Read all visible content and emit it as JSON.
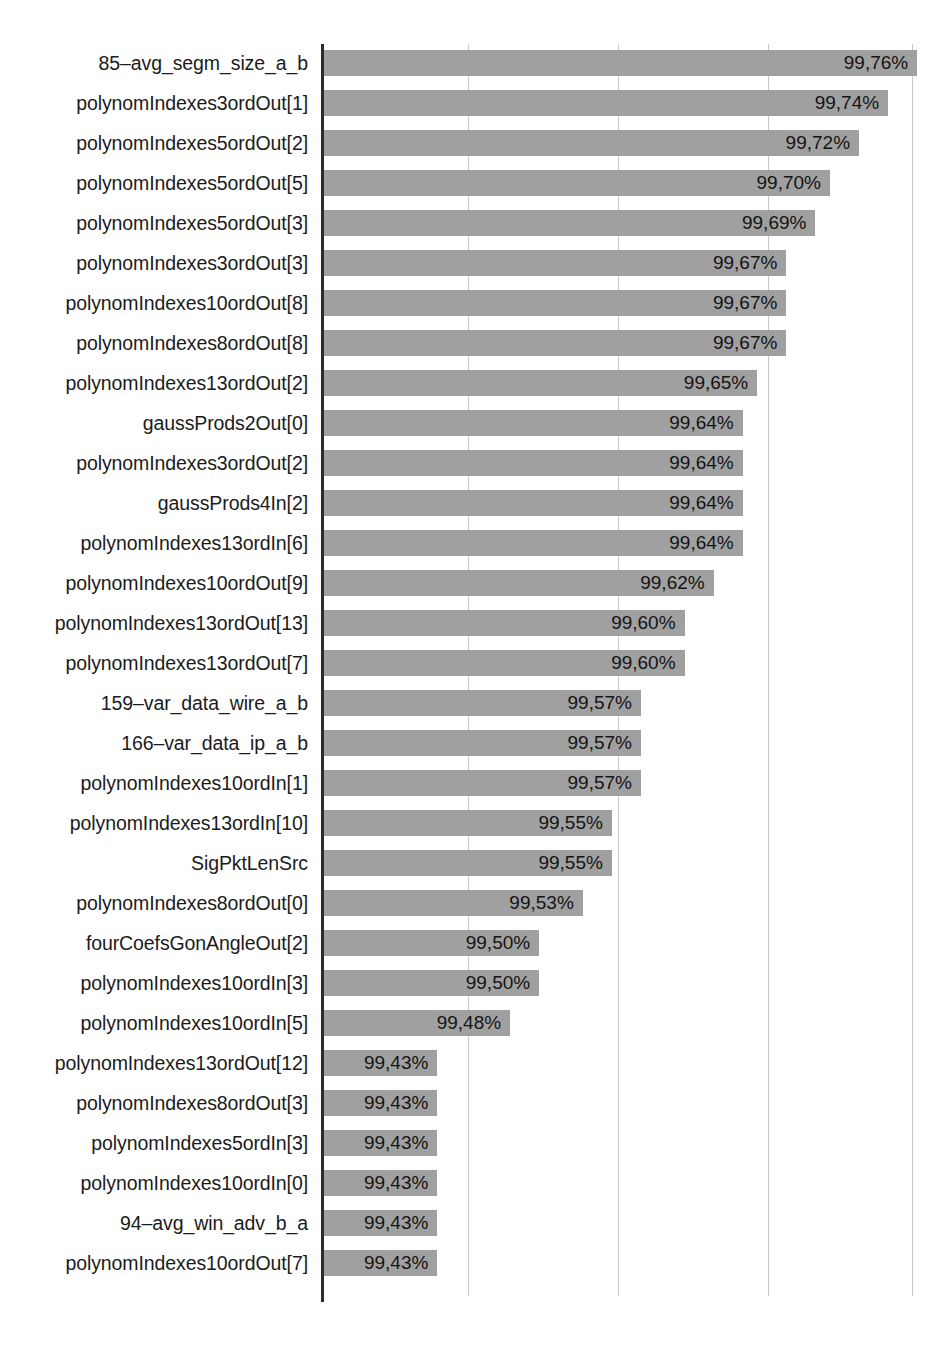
{
  "chart_data": {
    "type": "bar",
    "orientation": "horizontal",
    "title": "",
    "subtitle": "",
    "xlabel": "",
    "ylabel": "",
    "grid": true,
    "legend": null,
    "value_suffix": "%",
    "decimal_separator": ",",
    "xlim": [
      99.352,
      99.78
    ],
    "gridline_positions_px": [
      468,
      618,
      768,
      912
    ],
    "categories": [
      "85–avg_segm_size_a_b",
      "polynomIndexes3ordOut[1]",
      "polynomIndexes5ordOut[2]",
      "polynomIndexes5ordOut[5]",
      "polynomIndexes5ordOut[3]",
      "polynomIndexes3ordOut[3]",
      "polynomIndexes10ordOut[8]",
      "polynomIndexes8ordOut[8]",
      "polynomIndexes13ordOut[2]",
      "gaussProds2Out[0]",
      "polynomIndexes3ordOut[2]",
      "gaussProds4In[2]",
      "polynomIndexes13ordIn[6]",
      "polynomIndexes10ordOut[9]",
      "polynomIndexes13ordOut[13]",
      "polynomIndexes13ordOut[7]",
      "159–var_data_wire_a_b",
      "166–var_data_ip_a_b",
      "polynomIndexes10ordIn[1]",
      "polynomIndexes13ordIn[10]",
      "SigPktLenSrc",
      "polynomIndexes8ordOut[0]",
      "fourCoefsGonAngleOut[2]",
      "polynomIndexes10ordIn[3]",
      "polynomIndexes10ordIn[5]",
      "polynomIndexes13ordOut[12]",
      "polynomIndexes8ordOut[3]",
      "polynomIndexes5ordIn[3]",
      "polynomIndexes10ordIn[0]",
      "94–avg_win_adv_b_a",
      "polynomIndexes10ordOut[7]"
    ],
    "values": [
      99.76,
      99.74,
      99.72,
      99.7,
      99.69,
      99.67,
      99.67,
      99.67,
      99.65,
      99.64,
      99.64,
      99.64,
      99.64,
      99.62,
      99.6,
      99.6,
      99.57,
      99.57,
      99.57,
      99.55,
      99.55,
      99.53,
      99.5,
      99.5,
      99.48,
      99.43,
      99.43,
      99.43,
      99.43,
      99.43,
      99.43
    ],
    "value_labels": [
      "99,76%",
      "99,74%",
      "99,72%",
      "99,70%",
      "99,69%",
      "99,67%",
      "99,67%",
      "99,67%",
      "99,65%",
      "99,64%",
      "99,64%",
      "99,64%",
      "99,64%",
      "99,62%",
      "99,60%",
      "99,60%",
      "99,57%",
      "99,57%",
      "99,57%",
      "99,55%",
      "99,55%",
      "99,53%",
      "99,50%",
      "99,50%",
      "99,48%",
      "99,43%",
      "99,43%",
      "99,43%",
      "99,43%",
      "99,43%",
      "99,43%"
    ],
    "colors": {
      "bar": "#a0a0a0",
      "axis": "#2b2b2b",
      "gridline": "#c9c9c9",
      "text": "#1b1b1b",
      "background": "#ffffff"
    }
  }
}
